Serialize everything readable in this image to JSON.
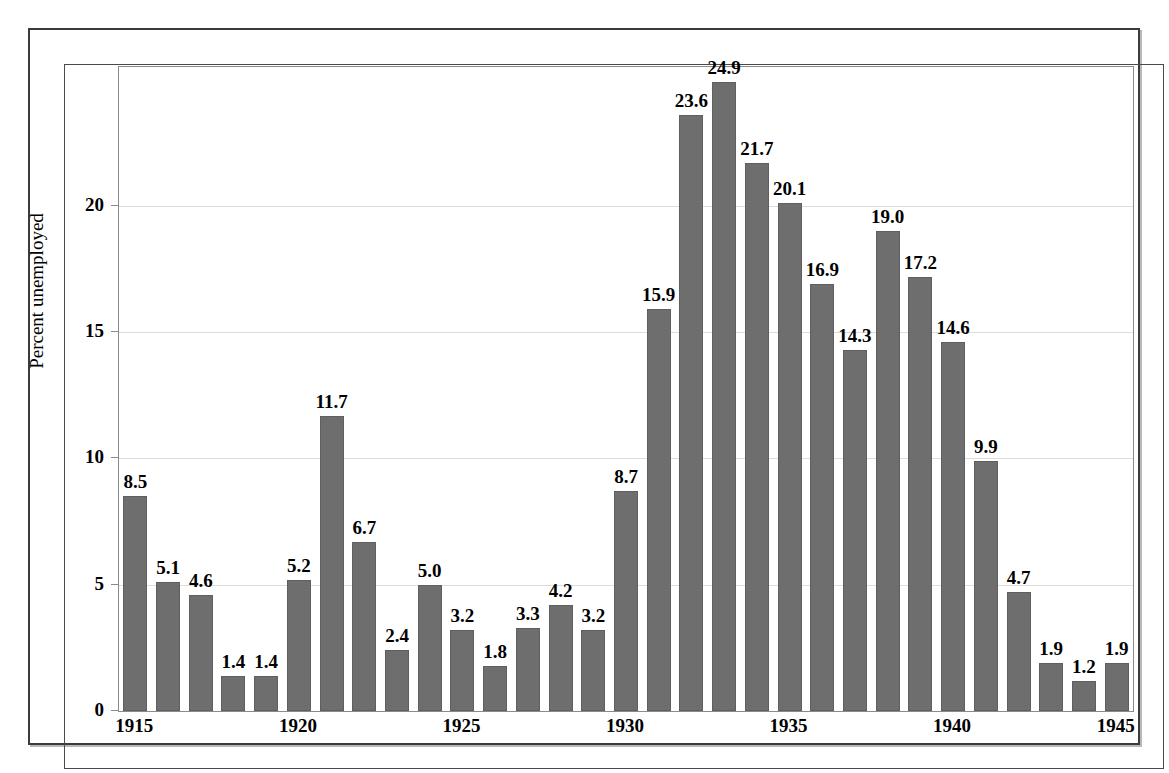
{
  "figure": {
    "bar_color": "#6e6e6e",
    "gridline_color": "#dcdcdc",
    "axis_color": "#8a8a8a",
    "frame_color": "#3b3b3b",
    "text_color": "#000000"
  },
  "chart_data": {
    "type": "bar",
    "title": "",
    "xlabel": "",
    "ylabel": "Percent unemployed",
    "ylim": [
      0,
      25.5
    ],
    "xlim": [
      1914.5,
      1945.5
    ],
    "grid": true,
    "legend": "none",
    "y_ticks": [
      0,
      5,
      10,
      15,
      20
    ],
    "y_tick_labels": [
      "0",
      "5",
      "10",
      "15",
      "20"
    ],
    "x_ticks": [
      1915,
      1920,
      1925,
      1930,
      1935,
      1940,
      1945
    ],
    "x_tick_labels": [
      "1915",
      "1920",
      "1925",
      "1930",
      "1935",
      "1940",
      "1945"
    ],
    "categories": [
      "1915",
      "1916",
      "1917",
      "1918",
      "1919",
      "1920",
      "1921",
      "1922",
      "1923",
      "1924",
      "1925",
      "1926",
      "1927",
      "1928",
      "1929",
      "1930",
      "1931",
      "1932",
      "1933",
      "1934",
      "1935",
      "1936",
      "1937",
      "1938",
      "1939",
      "1940",
      "1941",
      "1942",
      "1943",
      "1944",
      "1945"
    ],
    "values": [
      8.5,
      5.1,
      4.6,
      1.4,
      1.4,
      5.2,
      11.7,
      6.7,
      2.4,
      5.0,
      3.2,
      1.8,
      3.3,
      4.2,
      3.2,
      8.7,
      15.9,
      23.6,
      24.9,
      21.7,
      20.1,
      16.9,
      14.3,
      19.0,
      17.2,
      14.6,
      9.9,
      4.7,
      1.9,
      1.2,
      1.9
    ],
    "data_labels": [
      "8.5",
      "5.1",
      "4.6",
      "1.4",
      "1.4",
      "5.2",
      "11.7",
      "6.7",
      "2.4",
      "5.0",
      "3.2",
      "1.8",
      "3.3",
      "4.2",
      "3.2",
      "8.7",
      "15.9",
      "23.6",
      "24.9",
      "21.7",
      "20.1",
      "16.9",
      "14.3",
      "19.0",
      "17.2",
      "14.6",
      "9.9",
      "4.7",
      "1.9",
      "1.2",
      "1.9"
    ]
  }
}
